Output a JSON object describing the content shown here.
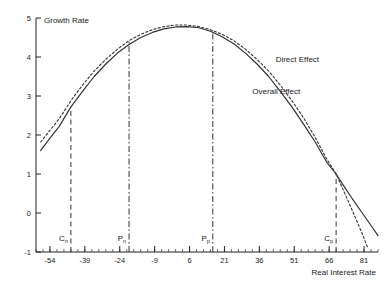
{
  "chart_data": {
    "type": "line",
    "title": "",
    "xlabel": "Real Interest Rate",
    "ylabel": "Growth Rate",
    "xlim": [
      -60,
      87
    ],
    "ylim": [
      -1,
      5
    ],
    "grid": false,
    "legend_position": "inline-annotations",
    "xticks": [
      -54,
      -39,
      -24,
      -9,
      6,
      21,
      36,
      51,
      66,
      81
    ],
    "xtick_labels": [
      "-54",
      "-39",
      "-24",
      "-9",
      "6",
      "21",
      "36",
      "51",
      "66",
      "81"
    ],
    "xtick_minor_step": 3,
    "yticks": [
      -1,
      0,
      1,
      2,
      3,
      4,
      5
    ],
    "ytick_labels": [
      "-1",
      "0",
      "1",
      "2",
      "3",
      "4",
      "5"
    ],
    "series": [
      {
        "name": "Overall Effect",
        "style": "solid",
        "color": "#333333",
        "label_x": 33,
        "label_y": 3.05,
        "points": [
          [
            -58.0,
            1.6
          ],
          [
            -54.0,
            1.92
          ],
          [
            -50.0,
            2.22
          ],
          [
            -45.0,
            2.72
          ],
          [
            -40.0,
            3.12
          ],
          [
            -35.0,
            3.5
          ],
          [
            -30.0,
            3.82
          ],
          [
            -25.0,
            4.1
          ],
          [
            -20.0,
            4.32
          ],
          [
            -15.0,
            4.5
          ],
          [
            -10.0,
            4.63
          ],
          [
            -5.0,
            4.72
          ],
          [
            0.0,
            4.77
          ],
          [
            5.0,
            4.78
          ],
          [
            10.0,
            4.75
          ],
          [
            15.0,
            4.66
          ],
          [
            20.0,
            4.52
          ],
          [
            25.0,
            4.34
          ],
          [
            30.0,
            4.1
          ],
          [
            35.0,
            3.82
          ],
          [
            40.0,
            3.5
          ],
          [
            45.0,
            3.12
          ],
          [
            50.0,
            2.72
          ],
          [
            55.0,
            2.28
          ],
          [
            60.0,
            1.82
          ],
          [
            65.0,
            1.3
          ],
          [
            69.0,
            1.0
          ],
          [
            72.0,
            0.72
          ],
          [
            76.0,
            0.36
          ],
          [
            80.0,
            0.02
          ],
          [
            84.0,
            -0.32
          ],
          [
            87.0,
            -0.58
          ]
        ]
      },
      {
        "name": "Direct Effect",
        "style": "dashed",
        "color": "#333333",
        "label_x": 43,
        "label_y": 3.88,
        "points": [
          [
            -58.0,
            1.82
          ],
          [
            -54.0,
            2.12
          ],
          [
            -50.0,
            2.42
          ],
          [
            -45.0,
            2.88
          ],
          [
            -40.0,
            3.28
          ],
          [
            -35.0,
            3.64
          ],
          [
            -30.0,
            3.94
          ],
          [
            -25.0,
            4.2
          ],
          [
            -20.0,
            4.42
          ],
          [
            -15.0,
            4.58
          ],
          [
            -10.0,
            4.7
          ],
          [
            -5.0,
            4.78
          ],
          [
            0.0,
            4.82
          ],
          [
            5.0,
            4.82
          ],
          [
            10.0,
            4.78
          ],
          [
            15.0,
            4.7
          ],
          [
            20.0,
            4.58
          ],
          [
            25.0,
            4.42
          ],
          [
            30.0,
            4.2
          ],
          [
            35.0,
            3.94
          ],
          [
            40.0,
            3.64
          ],
          [
            45.0,
            3.28
          ],
          [
            50.0,
            2.88
          ],
          [
            55.0,
            2.44
          ],
          [
            60.0,
            1.94
          ],
          [
            65.0,
            1.38
          ],
          [
            69.0,
            1.0
          ],
          [
            72.0,
            0.6
          ],
          [
            76.0,
            0.06
          ],
          [
            80.0,
            -0.5
          ],
          [
            82.5,
            -0.88
          ]
        ]
      }
    ],
    "markers": [
      {
        "name": "C_n",
        "label": "C",
        "sub": "n",
        "x": -45.0,
        "style": "dashed",
        "y_top": 2.72,
        "y_bottom": -1.0
      },
      {
        "name": "P_n",
        "label": "P",
        "sub": "n",
        "x": -20.0,
        "style": "dashdot",
        "y_top": 4.42,
        "y_bottom": -1.0
      },
      {
        "name": "P_p",
        "label": "P",
        "sub": "p",
        "x": 16.0,
        "style": "dashdot",
        "y_top": 4.68,
        "y_bottom": -1.0
      },
      {
        "name": "C_p",
        "label": "C",
        "sub": "p",
        "x": 69.0,
        "style": "dashed",
        "y_top": 1.0,
        "y_bottom": -1.0
      }
    ]
  }
}
